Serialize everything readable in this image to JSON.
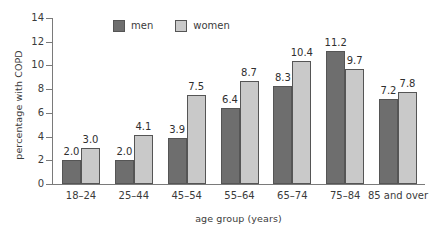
{
  "chart_data": {
    "type": "bar",
    "title": "",
    "subtitle": "",
    "xlabel": "age group (years)",
    "ylabel": "percentage with COPD",
    "categories": [
      "18–24",
      "25–44",
      "45–54",
      "55–64",
      "65–74",
      "75–84",
      "85 and over"
    ],
    "series": [
      {
        "name": "men",
        "color": "#6e6e6e",
        "values": [
          2.0,
          2.0,
          3.9,
          6.4,
          8.3,
          11.2,
          7.2
        ]
      },
      {
        "name": "women",
        "color": "#c9c9c9",
        "values": [
          3.0,
          4.1,
          7.5,
          8.7,
          10.4,
          9.7,
          7.8
        ]
      }
    ],
    "value_labels": [
      [
        "2.0",
        "3.0"
      ],
      [
        "2.0",
        "4.1"
      ],
      [
        "3.9",
        "7.5"
      ],
      [
        "6.4",
        "8.7"
      ],
      [
        "8.3",
        "10.4"
      ],
      [
        "11.2",
        "9.7"
      ],
      [
        "7.2",
        "7.8"
      ]
    ],
    "ylim": [
      0,
      14
    ],
    "yticks": [
      0,
      2,
      4,
      6,
      8,
      10,
      12,
      14
    ],
    "ytick_labels": [
      "0",
      "2",
      "4",
      "6",
      "8",
      "10",
      "12",
      "14"
    ],
    "grid": false,
    "legend_position": "top-center",
    "legend": [
      "men",
      "women"
    ]
  },
  "axes": {
    "y_title": "percentage with COPD",
    "x_title": "age group (years)"
  },
  "legend": {
    "men_label": "men",
    "women_label": "women"
  }
}
